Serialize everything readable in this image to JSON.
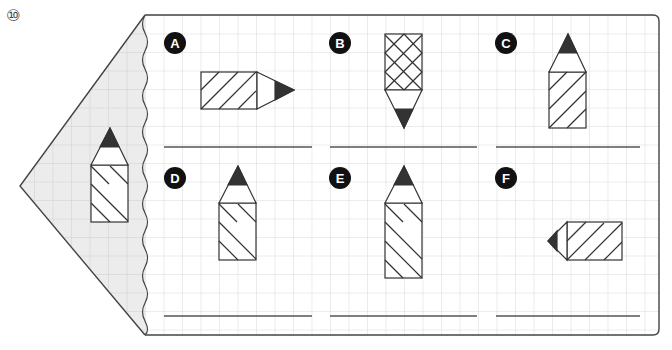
{
  "question": {
    "number_label": "⑩"
  },
  "grid": {
    "cell_px": 18.5,
    "origin_x": 145,
    "origin_y": 15,
    "line_color": "#d6d6d6"
  },
  "colors": {
    "outline": "#333333",
    "tip": "#333333",
    "grid_bg_left": "#ececec",
    "panel_bg": "#ffffff",
    "badge_bg": "#111111",
    "badge_text": "#ffffff",
    "answer_line": "#555555"
  },
  "reference_pencil": {
    "direction": "up",
    "pattern": "hatch-down"
  },
  "options": [
    {
      "label": "A",
      "direction": "right",
      "pattern": "hatch-up"
    },
    {
      "label": "B",
      "direction": "down",
      "pattern": "crosshatch"
    },
    {
      "label": "C",
      "direction": "up",
      "pattern": "hatch-up"
    },
    {
      "label": "D",
      "direction": "up",
      "pattern": "hatch-down"
    },
    {
      "label": "E",
      "direction": "up",
      "pattern": "hatch-down-long"
    },
    {
      "label": "F",
      "direction": "left",
      "pattern": "hatch-up"
    }
  ]
}
